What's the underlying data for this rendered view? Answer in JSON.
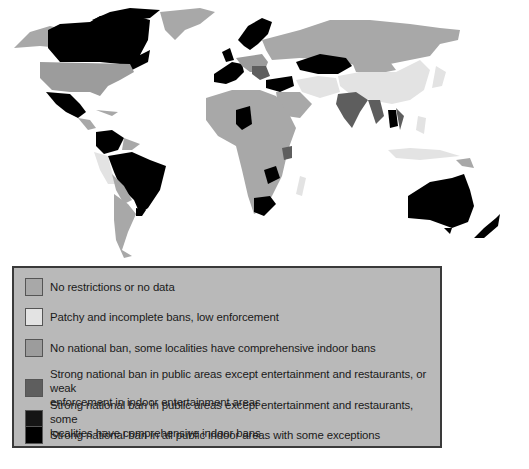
{
  "figure": {
    "type": "choropleth world map",
    "topic": "National smoking ban strength by country"
  },
  "colors": {
    "no_restrictions": "#a8a8a8",
    "patchy": "#e3e3e3",
    "localities": "#9c9c9c",
    "strong_except_weak": "#5e5e5e",
    "strong_except_localities": "#151515",
    "strong_all": "#000000",
    "ocean": "#ffffff",
    "legend_bg": "#b9b9b9"
  },
  "legend": {
    "items": [
      {
        "key": "no_restrictions",
        "label": "No restrictions or no data"
      },
      {
        "key": "patchy",
        "label": "Patchy and incomplete bans, low enforcement"
      },
      {
        "key": "localities",
        "label": "No national ban, some localities have comprehensive indoor bans"
      },
      {
        "key": "strong_except_weak",
        "label_line1": "Strong national ban in public areas except entertainment and restaurants, or weak",
        "label_line2": "enforcement in indoor entertainment areas"
      },
      {
        "key": "strong_except_localities",
        "label_line1": "Strong national ban in public areas except entertainment and restaurants, some",
        "label_line2": "localities have comprehensive indoor bans"
      },
      {
        "key": "strong_all",
        "label": "Strong national ban in all public indoor areas with some exceptions"
      }
    ]
  },
  "regions": {
    "strong_all": [
      "Canada",
      "Mexico",
      "Colombia",
      "Venezuela",
      "Brazil",
      "Uruguay",
      "Norway",
      "Sweden",
      "Finland",
      "UK",
      "Ireland",
      "France",
      "Spain",
      "Turkey",
      "Kazakhstan",
      "Niger",
      "Zambia",
      "Zimbabwe",
      "South Africa",
      "Australia",
      "New Zealand",
      "Thailand/Cambodia"
    ],
    "strong_except_weak": [
      "India",
      "Myanmar",
      "Balkans",
      "Tanzania",
      "Vietnam"
    ],
    "patchy": [
      "China",
      "Iran",
      "Peru",
      "Indonesia",
      "Madagascar"
    ],
    "no_restrictions": [
      "Russia",
      "Greenland",
      "Africa (most)",
      "Argentina",
      "Middle East"
    ],
    "localities": [
      "United States"
    ]
  }
}
